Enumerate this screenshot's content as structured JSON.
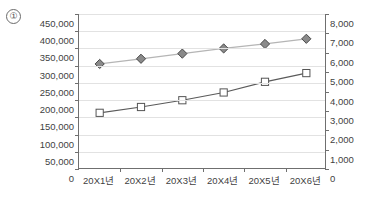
{
  "annotation": {
    "marker_label": "①"
  },
  "chart_data": {
    "type": "line",
    "title": "",
    "xlabel": "",
    "categories": [
      "20X1년",
      "20X2년",
      "20X3년",
      "20X4년",
      "20X5년",
      "20X6년"
    ],
    "grid": true,
    "legend": "none",
    "axes": {
      "left": {
        "label": "",
        "ylim": [
          0,
          450000
        ],
        "tick_step": 50000,
        "ticks": [
          "0",
          "50,000",
          "100,000",
          "150,000",
          "200,000",
          "250,000",
          "300,000",
          "350,000",
          "400,000",
          "450,000"
        ]
      },
      "right": {
        "label": "",
        "ylim": [
          0,
          8000
        ],
        "tick_step": 1000,
        "ticks": [
          "0",
          "1,000",
          "2,000",
          "3,000",
          "4,000",
          "5,000",
          "6,000",
          "7,000",
          "8,000"
        ]
      }
    },
    "series": [
      {
        "name": "diamond-series",
        "axis": "left",
        "marker": "diamond",
        "marker_fill": "#8a8a8a",
        "marker_stroke": "#4a4a4a",
        "line_color": "#b5b5b5",
        "values": [
          305000,
          320000,
          335000,
          350000,
          363000,
          378000
        ]
      },
      {
        "name": "square-series",
        "axis": "right",
        "marker": "square",
        "marker_fill": "#ffffff",
        "marker_stroke": "#555555",
        "line_color": "#5a5a5a",
        "values": [
          2900,
          3200,
          3550,
          3950,
          4500,
          4950
        ]
      }
    ]
  }
}
